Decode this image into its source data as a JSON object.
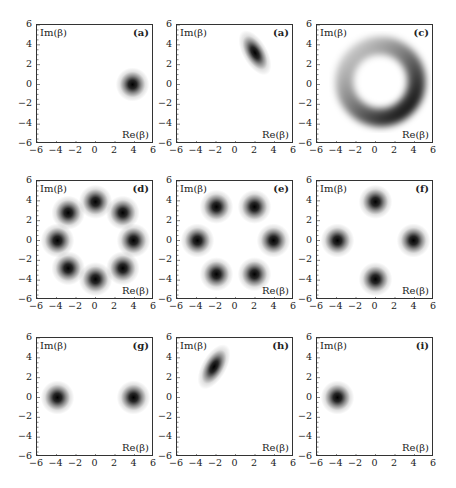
{
  "chart_data": [
    {
      "type": "heatmap",
      "panel_label": "(a)",
      "xlabel": "Re(β)",
      "ylabel": "Im(β)",
      "xlim": [
        -6,
        6
      ],
      "ylim": [
        -6,
        6
      ],
      "xticks": [
        "−6",
        "−4",
        "−2",
        "0",
        "2",
        "4",
        "6"
      ],
      "yticks": [
        "6",
        "4",
        "2",
        "0",
        "−2",
        "−4",
        "−6"
      ],
      "blobs": [
        {
          "x": 3.8,
          "y": 0,
          "sx": 0.75,
          "sy": 0.75,
          "rot": 0,
          "amp": 1
        }
      ]
    },
    {
      "type": "heatmap",
      "panel_label": "(a)",
      "xlabel": "Re(β)",
      "ylabel": "Im(β)",
      "xlim": [
        -6,
        6
      ],
      "ylim": [
        -6,
        6
      ],
      "xticks": [
        "−6",
        "−4",
        "−2",
        "0",
        "2",
        "4",
        "6"
      ],
      "yticks": [
        "6",
        "4",
        "2",
        "0",
        "−2",
        "−4",
        "−6"
      ],
      "blobs": [
        {
          "x": 2.0,
          "y": 3.2,
          "sx": 0.55,
          "sy": 1.1,
          "rot": -30,
          "amp": 1
        }
      ]
    },
    {
      "type": "heatmap",
      "panel_label": "(c)",
      "xlabel": "Re(β)",
      "ylabel": "Im(β)",
      "xlim": [
        -6,
        6
      ],
      "ylim": [
        -6,
        6
      ],
      "xticks": [
        "−6",
        "−4",
        "−2",
        "0",
        "2",
        "4",
        "6"
      ],
      "yticks": [
        "6",
        "4",
        "2",
        "0",
        "−2",
        "−4",
        "−6"
      ],
      "ring": {
        "cx": 0.5,
        "cy": 0.3,
        "r": 3.7,
        "width": 0.75,
        "darkest_angle_deg": -40
      }
    },
    {
      "type": "heatmap",
      "panel_label": "(d)",
      "xlabel": "Re(β)",
      "ylabel": "Im(β)",
      "xlim": [
        -6,
        6
      ],
      "ylim": [
        -6,
        6
      ],
      "xticks": [
        "−6",
        "−4",
        "−2",
        "0",
        "2",
        "4",
        "6"
      ],
      "yticks": [
        "6",
        "4",
        "2",
        "0",
        "−2",
        "−4",
        "−6"
      ],
      "blobs": [
        {
          "x": 3.9,
          "y": 0
        },
        {
          "x": 2.8,
          "y": 2.8
        },
        {
          "x": 0,
          "y": 3.9
        },
        {
          "x": -2.8,
          "y": 2.8
        },
        {
          "x": -3.9,
          "y": 0
        },
        {
          "x": -2.8,
          "y": -2.8
        },
        {
          "x": 0,
          "y": -3.9
        },
        {
          "x": 2.8,
          "y": -2.8
        }
      ]
    },
    {
      "type": "heatmap",
      "panel_label": "(e)",
      "xlabel": "Re(β)",
      "ylabel": "Im(β)",
      "xlim": [
        -6,
        6
      ],
      "ylim": [
        -6,
        6
      ],
      "xticks": [
        "−6",
        "−4",
        "−2",
        "0",
        "2",
        "4",
        "6"
      ],
      "yticks": [
        "6",
        "4",
        "2",
        "0",
        "−2",
        "−4",
        "−6"
      ],
      "blobs": [
        {
          "x": 3.9,
          "y": 0
        },
        {
          "x": 1.95,
          "y": 3.4
        },
        {
          "x": -1.95,
          "y": 3.4
        },
        {
          "x": -3.9,
          "y": 0
        },
        {
          "x": -1.95,
          "y": -3.4
        },
        {
          "x": 1.95,
          "y": -3.4
        }
      ]
    },
    {
      "type": "heatmap",
      "panel_label": "(f)",
      "xlabel": "Re(β)",
      "ylabel": "Im(β)",
      "xlim": [
        -6,
        6
      ],
      "ylim": [
        -6,
        6
      ],
      "xticks": [
        "−6",
        "−4",
        "−2",
        "0",
        "2",
        "4",
        "6"
      ],
      "yticks": [
        "6",
        "4",
        "2",
        "0",
        "−2",
        "−4",
        "−6"
      ],
      "blobs": [
        {
          "x": 3.9,
          "y": 0
        },
        {
          "x": 0,
          "y": 3.9
        },
        {
          "x": -3.9,
          "y": 0
        },
        {
          "x": 0,
          "y": -3.9
        }
      ]
    },
    {
      "type": "heatmap",
      "panel_label": "(g)",
      "xlabel": "Re(β)",
      "ylabel": "Im(β)",
      "xlim": [
        -6,
        6
      ],
      "ylim": [
        -6,
        6
      ],
      "xticks": [
        "−6",
        "−4",
        "−2",
        "0",
        "2",
        "4",
        "6"
      ],
      "yticks": [
        "6",
        "4",
        "2",
        "0",
        "−2",
        "−4",
        "−6"
      ],
      "blobs": [
        {
          "x": 3.9,
          "y": 0
        },
        {
          "x": -3.9,
          "y": 0
        }
      ]
    },
    {
      "type": "heatmap",
      "panel_label": "(h)",
      "xlabel": "Re(β)",
      "ylabel": "Im(β)",
      "xlim": [
        -6,
        6
      ],
      "ylim": [
        -6,
        6
      ],
      "xticks": [
        "−6",
        "−4",
        "−2",
        "0",
        "2",
        "4",
        "6"
      ],
      "yticks": [
        "6",
        "4",
        "2",
        "0",
        "−2",
        "−4",
        "−6"
      ],
      "blobs": [
        {
          "x": -2.2,
          "y": 3.1,
          "sx": 0.55,
          "sy": 1.1,
          "rot": 30,
          "amp": 1
        }
      ]
    },
    {
      "type": "heatmap",
      "panel_label": "(i)",
      "xlabel": "Re(β)",
      "ylabel": "Im(β)",
      "xlim": [
        -6,
        6
      ],
      "ylim": [
        -6,
        6
      ],
      "xticks": [
        "−6",
        "−4",
        "−2",
        "0",
        "2",
        "4",
        "6"
      ],
      "yticks": [
        "6",
        "4",
        "2",
        "0",
        "−2",
        "−4",
        "−6"
      ],
      "blobs": [
        {
          "x": -3.9,
          "y": 0,
          "sx": 0.75,
          "sy": 0.75,
          "rot": 0,
          "amp": 1
        }
      ]
    }
  ],
  "layout": {
    "panel_positions": [
      {
        "left": 36,
        "top": 24
      },
      {
        "left": 176,
        "top": 24
      },
      {
        "left": 316,
        "top": 24
      },
      {
        "left": 36,
        "top": 180
      },
      {
        "left": 176,
        "top": 180
      },
      {
        "left": 316,
        "top": 180
      },
      {
        "left": 36,
        "top": 337
      },
      {
        "left": 176,
        "top": 337
      },
      {
        "left": 316,
        "top": 337
      }
    ]
  }
}
